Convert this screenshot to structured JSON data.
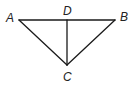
{
  "diagram": {
    "type": "geometry-triangle",
    "stroke_color": "#1a1a1a",
    "label_color": "#222222",
    "points": {
      "A": {
        "label": "A",
        "x": 19,
        "y": 20
      },
      "B": {
        "label": "B",
        "x": 115,
        "y": 20
      },
      "C": {
        "label": "C",
        "x": 67,
        "y": 65
      },
      "D": {
        "label": "D",
        "x": 67,
        "y": 20
      }
    },
    "segments": [
      {
        "name": "AB",
        "from": "A",
        "to": "B"
      },
      {
        "name": "AC",
        "from": "A",
        "to": "C"
      },
      {
        "name": "BC",
        "from": "B",
        "to": "C"
      },
      {
        "name": "DC",
        "from": "D",
        "to": "C"
      }
    ],
    "labels": {
      "A": "A",
      "B": "B",
      "C": "C",
      "D": "D"
    }
  }
}
